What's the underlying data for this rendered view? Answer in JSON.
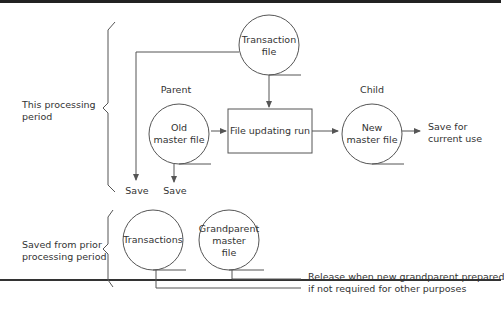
{
  "diagram": {
    "brackets": {
      "current": {
        "label_line1": "This processing",
        "label_line2": "period"
      },
      "prior": {
        "label_line1": "Saved from prior",
        "label_line2": "processing period"
      }
    },
    "nodes": {
      "transaction_file": {
        "line1": "Transaction",
        "line2": "file"
      },
      "old_master": {
        "role": "Parent",
        "line1": "Old",
        "line2": "master file"
      },
      "update_run": {
        "label": "File updating run"
      },
      "new_master": {
        "role": "Child",
        "line1": "New",
        "line2": "master file"
      },
      "transactions": {
        "label": "Transactions"
      },
      "grandparent": {
        "line1": "Grandparent",
        "line2": "master",
        "line3": "file"
      }
    },
    "outputs": {
      "save_transaction": "Save",
      "save_old_master": "Save",
      "save_current_line1": "Save for",
      "save_current_line2": "current use",
      "release_line1": "Release when new grandparent prepared",
      "release_line2": "if not required for other purposes"
    },
    "colors": {
      "line": "#555555",
      "text": "#333333",
      "rule": "#222222"
    }
  }
}
